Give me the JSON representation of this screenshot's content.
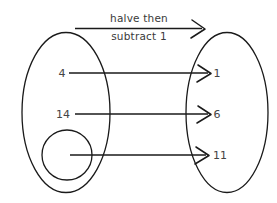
{
  "diagram": {
    "type": "mapping-diagram",
    "rule_label": {
      "line1": "halve then",
      "line2": "subtract 1"
    },
    "domain_set": {
      "name": "input-set",
      "elements": [
        {
          "id": "input-1",
          "value": "4"
        },
        {
          "id": "input-2",
          "value": "14"
        },
        {
          "id": "input-3",
          "value": ""
        }
      ],
      "highlight_shape": "circle"
    },
    "range_set": {
      "name": "output-set",
      "elements": [
        {
          "id": "output-1",
          "value": "1"
        },
        {
          "id": "output-2",
          "value": "6"
        },
        {
          "id": "output-3",
          "value": "11"
        }
      ]
    },
    "mappings": [
      {
        "from": "4",
        "to": "1"
      },
      {
        "from": "14",
        "to": "6"
      },
      {
        "from": "",
        "to": "11"
      }
    ],
    "colors": {
      "ink": "#1a1a1a",
      "text": "#3a3a3a",
      "background": "#ffffff"
    }
  }
}
